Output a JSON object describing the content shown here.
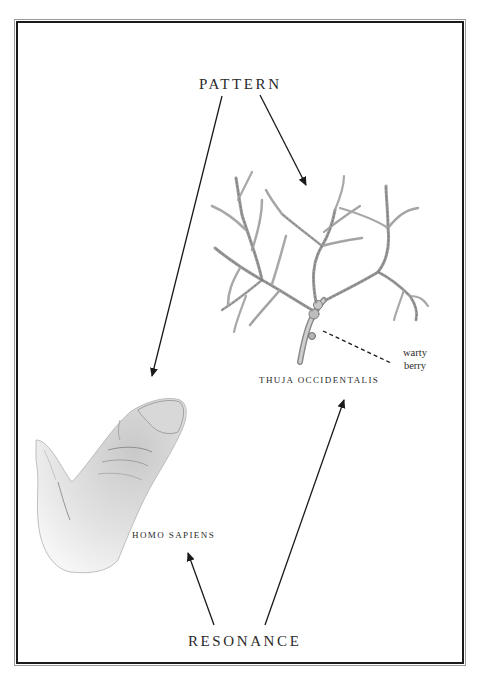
{
  "diagram": {
    "top_label": "PATTERN",
    "bottom_label": "RESONANCE",
    "plant": {
      "name": "THUJA OCCIDENTALIS",
      "callout_line1": "warty",
      "callout_line2": "berry"
    },
    "human": {
      "name": "HOMO SAPIENS"
    },
    "colors": {
      "ink": "#1a1a1a",
      "text": "#2a2a2a",
      "sketch": "#8a8a8a",
      "background": "#ffffff"
    },
    "arrows": [
      {
        "from": "PATTERN",
        "to": "HOMO SAPIENS drawing"
      },
      {
        "from": "PATTERN",
        "to": "THUJA OCCIDENTALIS drawing"
      },
      {
        "from": "RESONANCE",
        "to": "HOMO SAPIENS"
      },
      {
        "from": "RESONANCE",
        "to": "THUJA OCCIDENTALIS"
      }
    ]
  }
}
